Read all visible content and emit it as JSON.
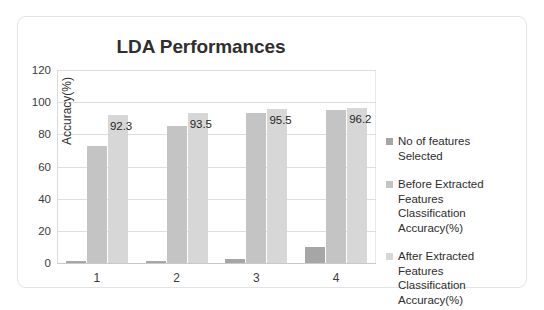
{
  "chart_data": {
    "type": "bar",
    "title": "LDA Performances",
    "xlabel": "",
    "ylabel": "Accuracy(%)",
    "categories": [
      "1",
      "2",
      "3",
      "4"
    ],
    "ylim": [
      0,
      120
    ],
    "yticks": [
      "0",
      "20",
      "40",
      "60",
      "80",
      "100",
      "120"
    ],
    "grid": true,
    "legend_position": "right",
    "series": [
      {
        "name": "No of features Selected",
        "color": "#a6a6a6",
        "values": [
          1,
          1.5,
          2.5,
          10
        ],
        "labels": [
          "",
          "",
          "",
          ""
        ]
      },
      {
        "name": "Before Extracted Features Classification Accuracy(%)",
        "color": "#c4c4c4",
        "values": [
          73,
          85.5,
          93,
          95
        ],
        "labels": [
          "",
          "",
          "",
          ""
        ]
      },
      {
        "name": "After Extracted Features Classification Accuracy(%)",
        "color": "#d7d7d7",
        "values": [
          92.3,
          93.5,
          95.5,
          96.2
        ],
        "labels": [
          "92.3",
          "93.5",
          "95.5",
          "96.2"
        ]
      }
    ]
  },
  "legend": {
    "items": [
      {
        "label_line1": "No of features Selected",
        "label_line2": ""
      },
      {
        "label_line1": "Before Extracted Features",
        "label_line2": "Classification Accuracy(%)"
      },
      {
        "label_line1": "After Extracted Features",
        "label_line2": "Classification Accuracy(%)"
      }
    ]
  }
}
